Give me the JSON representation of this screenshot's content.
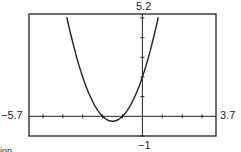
{
  "chart_data": {
    "type": "line",
    "title": "",
    "xlabel": "",
    "ylabel": "",
    "xlim": [
      -5.7,
      3.7
    ],
    "ylim": [
      -1,
      5.2
    ],
    "window_labels": {
      "xmin": "−5.7",
      "xmax": "3.7",
      "ymin": "−1",
      "ymax": "5.2"
    },
    "grid": false,
    "tick_marks": {
      "x_step": 1,
      "y_step": 1
    },
    "series": [
      {
        "name": "y = x^2 + 3x + 2",
        "x": [
          -3.85,
          -3.5,
          -3,
          -2.5,
          -2,
          -1.5,
          -1,
          -0.5,
          0,
          0.5,
          0.85
        ],
        "values": [
          5.27,
          3.75,
          2,
          0.75,
          0,
          -0.25,
          0,
          0.75,
          2,
          3.75,
          5.27
        ]
      }
    ]
  },
  "caption_fragment": "ion"
}
